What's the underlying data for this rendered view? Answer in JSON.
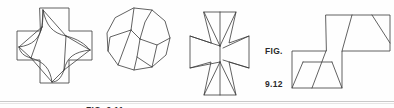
{
  "page": {
    "width": 394,
    "height": 108,
    "background_color": "#fefefe",
    "ink_color": "#3a3a3a",
    "caption_color": "#2b2b2b"
  },
  "captions": {
    "fig_911": "FIG. 9.11",
    "fig_912_line1": "FIG.",
    "fig_912_line2": "9.12"
  },
  "figures": [
    {
      "id": "greek-cross-star-dissection",
      "belongs_to": "FIG. 9.11",
      "description": "Greek cross outline with an inscribed four-pointed concave star dissection"
    },
    {
      "id": "rounded-polygon-dissection",
      "belongs_to": "FIG. 9.11",
      "description": "Near-circular polygon cut into pieces by internal lines"
    },
    {
      "id": "maltese-cross-dissection",
      "belongs_to": "FIG. 9.12",
      "description": "Cross shape built from four trapezoidal wings with radiating cut lines"
    },
    {
      "id": "zigzag-step-polygon",
      "belongs_to": "FIG. 9.12",
      "description": "Z-shaped step polygon with internal trapezoid and triangle cuts"
    }
  ],
  "shapes": {
    "cross_outline": "M 40,8 L 69,8 L 69,31 L 92,31 L 92,60 L 69,60 L 69,83 L 40,83 L 40,60 L 17,60 L 17,31 L 40,31 Z",
    "star_curves": [
      "M 43,10 C 45,26 52,33 66,36",
      "M 66,36 C 79,39 85,44 90,50",
      "M 90,50 C 74,52 67,57 64,70",
      "M 64,70 C 61,80 57,82 52,82",
      "M 52,82 C 50,68 44,62 31,58",
      "M 31,58 C 22,56 20,52 19,47",
      "M 19,47 C 33,45 39,39 42,27",
      "M 42,27 C 43,20 43,14 43,10"
    ],
    "star_chords": [
      "M 43,10 L 66,36",
      "M 66,36 L 90,50",
      "M 90,50 L 64,70",
      "M 64,70 L 52,82",
      "M 52,82 L 31,58",
      "M 31,58 L 19,47",
      "M 19,47 L 42,27",
      "M 42,27 L 43,10",
      "M 66,36 L 64,70",
      "M 31,58 L 42,27"
    ],
    "polygon_outline": "M 134,8 L 152,10 L 165,21 L 170,38 L 166,55 L 152,67 L 134,70 L 118,65 L 108,51 L 107,33 L 115,18 Z",
    "polygon_cuts": [
      "M 134,8 L 131,30 L 140,39",
      "M 140,39 L 145,22 L 152,10",
      "M 140,39 L 136,58 L 134,70",
      "M 140,39 L 157,45 L 170,38",
      "M 131,30 L 110,37 L 108,51",
      "M 136,58 L 152,67",
      "M 157,45 L 152,67",
      "M 131,30 L 118,65"
    ],
    "maltese_outline": "M 204,12 L 236,12 L 229,43 L 249,36 L 249,68 L 229,62 L 236,95 L 204,95 L 211,62 L 190,68 L 190,36 L 211,43 Z",
    "maltese_cuts": [
      "M 204,12 L 220,46",
      "M 236,12 L 220,46",
      "M 190,36 L 220,46",
      "M 249,36 L 223,48",
      "M 204,95 L 220,62",
      "M 236,95 L 220,62",
      "M 190,68 L 220,62",
      "M 249,68 L 223,60",
      "M 220,46 L 220,12",
      "M 220,62 L 220,95",
      "M 220,46 L 220,62"
    ],
    "zigzag_outline": "M 326,15 L 390,15 L 390,51 L 342,51 L 342,88 L 292,88 L 292,51 L 326,51 Z",
    "zigzag_cuts": [
      "M 352,15 L 342,51",
      "M 372,15 L 390,40",
      "M 326,51 L 312,88",
      "M 342,88 L 330,62",
      "M 330,62 L 304,62",
      "M 304,62 L 292,88"
    ]
  }
}
